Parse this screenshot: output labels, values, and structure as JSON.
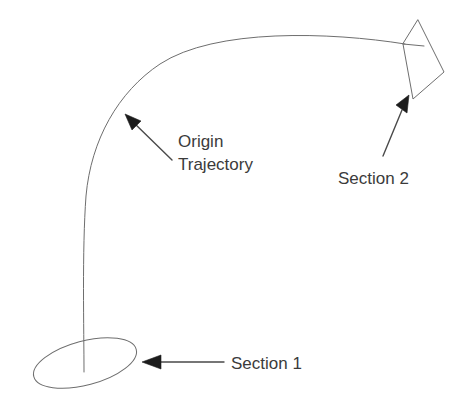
{
  "diagram": {
    "background_color": "#ffffff",
    "line_color": "#6e6e6e",
    "text_color": "#3b3b3b",
    "arrow_color": "#1c1c1c",
    "width": 452,
    "height": 420
  },
  "labels": {
    "origin_trajectory_line1": "Origin",
    "origin_trajectory_line2": "Trajectory",
    "section_1": "Section 1",
    "section_2": "Section 2"
  },
  "shapes": {
    "section_1_ellipse": {
      "name": "Section 1",
      "type": "ellipse",
      "cx": 85,
      "cy": 363,
      "rx": 53,
      "ry": 22,
      "rotation_deg": -15
    },
    "section_2_quad": {
      "name": "Section 2",
      "type": "quadrilateral",
      "points": "418,20 444,72 413,99 403,44"
    },
    "trajectory_curve": {
      "name": "Origin Trajectory",
      "type": "curve",
      "start": [
        84,
        372
      ],
      "end": [
        405,
        44
      ]
    }
  },
  "annotations": [
    {
      "name": "origin-trajectory-callout",
      "label_lines": [
        "Origin",
        "Trajectory"
      ],
      "leader_from": [
        172,
        160
      ],
      "leader_to": [
        127,
        117
      ],
      "arrow_direction": "up-left"
    },
    {
      "name": "section-2-callout",
      "label": "Section 2",
      "leader_from": [
        383,
        156
      ],
      "leader_to": [
        409,
        96
      ],
      "arrow_direction": "up-right"
    },
    {
      "name": "section-1-callout",
      "label": "Section 1",
      "leader_from": [
        224,
        362
      ],
      "leader_to": [
        143,
        362
      ],
      "arrow_direction": "left"
    }
  ]
}
